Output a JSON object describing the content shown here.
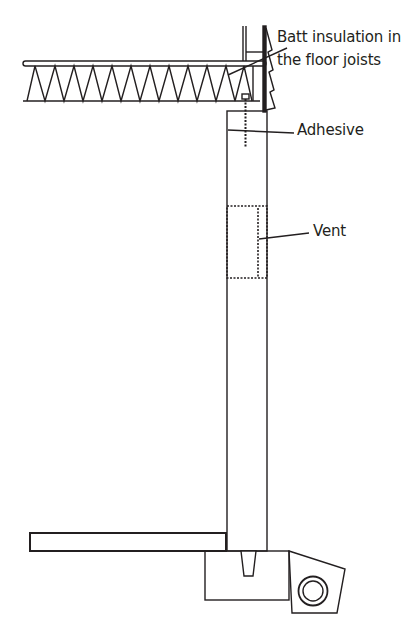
{
  "diagram": {
    "type": "building-section",
    "labels": {
      "batt_line1": "Batt insulation in",
      "batt_line2": "the floor joists",
      "adhesive": "Adhesive",
      "vent": "Vent"
    },
    "components": [
      {
        "name": "floor-joist-batt-insulation"
      },
      {
        "name": "rim-siding-shingles"
      },
      {
        "name": "foundation-wall"
      },
      {
        "name": "anchor-bolt"
      },
      {
        "name": "vent-opening"
      },
      {
        "name": "basement-slab"
      },
      {
        "name": "footing"
      },
      {
        "name": "drain-pipe"
      }
    ],
    "colors": {
      "line": "#231f20",
      "background": "#ffffff"
    }
  }
}
